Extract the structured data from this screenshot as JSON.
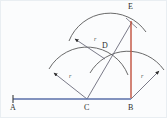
{
  "figure": {
    "background_color": "#fbfcfd",
    "border_color": "#e9eef2",
    "baseline_color": "#5a6fa8",
    "arc_color": "#595959",
    "ray_color": "#6b6b7a",
    "perpendicular_color": "#c0503c"
  },
  "points": [
    {
      "id": "A",
      "label": "A",
      "x": 12,
      "y": 98,
      "label_x": 9,
      "label_y": 104
    },
    {
      "id": "C",
      "label": "C",
      "x": 86,
      "y": 98,
      "label_x": 83,
      "label_y": 104
    },
    {
      "id": "B",
      "label": "B",
      "x": 130,
      "y": 98,
      "label_x": 127,
      "label_y": 104
    },
    {
      "id": "D",
      "label": "D",
      "x": 104,
      "y": 58,
      "label_x": 100,
      "label_y": 44
    },
    {
      "id": "E",
      "label": "E",
      "x": 130,
      "y": 22,
      "label_x": 127,
      "label_y": 3
    }
  ],
  "radius_labels": [
    {
      "id": "r-left",
      "text": "r",
      "x": 68,
      "y": 74
    },
    {
      "id": "r-right",
      "text": "r",
      "x": 140,
      "y": 74
    },
    {
      "id": "r-upper",
      "text": "r",
      "x": 93,
      "y": 37
    }
  ],
  "segments": [
    {
      "id": "baseline-A-B",
      "from": "A",
      "to": "B",
      "color": "#5a6fa8",
      "label": "line AB"
    },
    {
      "id": "perpendicular-B-E",
      "from": "B",
      "to": "E",
      "color": "#c0503c",
      "label": "perpendicular BE"
    }
  ],
  "arcs": [
    {
      "id": "arc-center-C",
      "center": "C",
      "label": "arc centered at C, radius r"
    },
    {
      "id": "arc-center-B",
      "center": "B",
      "label": "arc centered at B, radius r"
    },
    {
      "id": "arc-center-D",
      "center": "D",
      "label": "arc centered at D, radius r"
    }
  ],
  "rays": [
    {
      "id": "ray-C-to-arc",
      "from": "C",
      "label": "radius ray from C"
    },
    {
      "id": "ray-B-to-arc",
      "from": "B",
      "label": "radius ray from B"
    },
    {
      "id": "ray-D-to-arc",
      "from": "D",
      "label": "radius ray from D"
    },
    {
      "id": "ray-C-to-E",
      "from": "C",
      "label": "ray from C through D to E"
    }
  ],
  "tick": {
    "id": "tick-A",
    "label": "endpoint tick at A"
  }
}
